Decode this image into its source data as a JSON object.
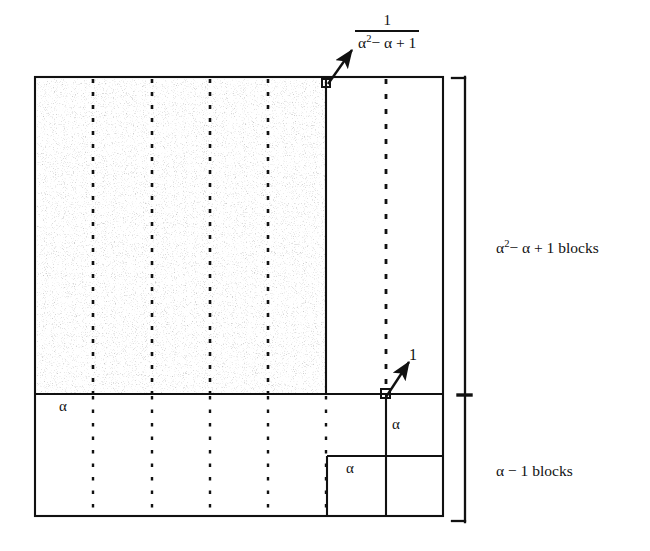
{
  "figure": {
    "type": "mathematical-block-decomposition-diagram",
    "labels": {
      "top_fraction_numerator": "1",
      "top_fraction_denominator_alpha": "α",
      "top_fraction_denominator_exp": "2",
      "top_fraction_denominator_rest": "− α + 1",
      "arrow_upper_target": "1 / (α² − α + 1)",
      "arrow_lower_label": "1",
      "left_region_alpha": "α",
      "right_column_alpha": "α",
      "bottom_inner_alpha": "α",
      "bracket_upper_alpha": "α",
      "bracket_upper_exp": "2",
      "bracket_upper_rest": "− α + 1 blocks",
      "bracket_upper_full": "α² − α + 1 blocks",
      "bracket_lower_full": "α − 1 blocks"
    },
    "colors": {
      "ink": "#111111",
      "background": "#ffffff"
    },
    "geometry": {
      "outer_box": {
        "x": 35,
        "y": 77,
        "width": 408,
        "height": 439
      },
      "horizontal_divider_y": 394,
      "vertical_divider_x": 326,
      "right_column_dotted_x": 386,
      "inner_box_x": 327,
      "inner_box_y": 456,
      "main_dotted_columns_x": [
        93,
        152,
        210,
        268
      ],
      "bracket_x": 465,
      "bracket_top_y": 77,
      "bracket_mid_y": 395,
      "bracket_bottom_y": 522,
      "upper_arrow": {
        "from_x": 330,
        "from_y": 82,
        "to_x": 352,
        "to_y": 50
      },
      "lower_arrow": {
        "from_x": 387,
        "from_y": 396,
        "to_x": 408,
        "to_y": 362
      },
      "corner_marker_upper": {
        "x": 325,
        "y": 79,
        "size": 7
      },
      "corner_marker_lower": {
        "x": 382,
        "y": 390,
        "size": 8
      }
    }
  }
}
